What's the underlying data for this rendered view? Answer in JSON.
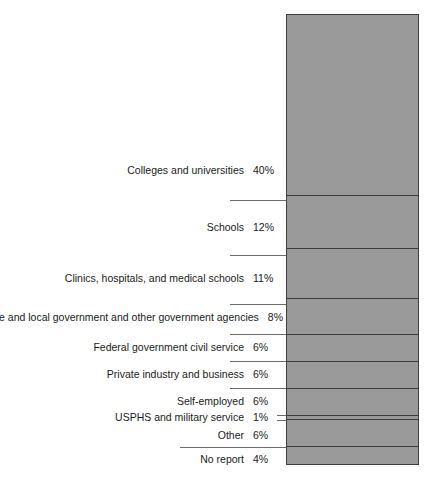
{
  "chart_data": {
    "type": "bar",
    "title": "",
    "subtitle": "",
    "xlabel": "",
    "ylabel": "",
    "orientation": "vertical-stacked",
    "unit": "percent",
    "total": 100,
    "grid": false,
    "legend_position": "left-labels",
    "categories": [
      "Colleges and universities",
      "Schools",
      "Clinics, hospitals, and medical schools",
      "State and local government and other government agencies",
      "Federal government civil service",
      "Private industry and business",
      "Self-employed",
      "USPHS and military service",
      "Other",
      "No report"
    ],
    "values": [
      40,
      12,
      11,
      8,
      6,
      6,
      6,
      1,
      6,
      4
    ],
    "value_labels": [
      "40%",
      "12%",
      "11%",
      "8%",
      "6%",
      "6%",
      "6%",
      "1%",
      "6%",
      "4%"
    ],
    "segments": [
      {
        "label": "Colleges and universities",
        "value": 40,
        "value_label": "40%",
        "color": "#9a9a9a"
      },
      {
        "label": "Schools",
        "value": 12,
        "value_label": "12%",
        "color": "#9a9a9a"
      },
      {
        "label": "Clinics, hospitals, and medical schools",
        "value": 11,
        "value_label": "11%",
        "color": "#9a9a9a"
      },
      {
        "label": "State and local government and other government agencies",
        "value": 8,
        "value_label": "8%",
        "color": "#9a9a9a"
      },
      {
        "label": "Federal government civil service",
        "value": 6,
        "value_label": "6%",
        "color": "#9a9a9a"
      },
      {
        "label": "Private industry and business",
        "value": 6,
        "value_label": "6%",
        "color": "#9a9a9a"
      },
      {
        "label": "Self-employed",
        "value": 6,
        "value_label": "6%",
        "color": "#9a9a9a"
      },
      {
        "label": "USPHS and military service",
        "value": 1,
        "value_label": "1%",
        "color": "#9a9a9a"
      },
      {
        "label": "Other",
        "value": 6,
        "value_label": "6%",
        "color": "#9a9a9a"
      },
      {
        "label": "No report",
        "value": 4,
        "value_label": "4%",
        "color": "#9a9a9a"
      }
    ],
    "colors": {
      "bar_fill": "#9a9a9a",
      "bar_outline": "#3d3d3d",
      "divider": "#3d3d3d",
      "leader_line": "#6d6d6d",
      "text": "#1a1a1a",
      "background": "#ffffff"
    }
  }
}
